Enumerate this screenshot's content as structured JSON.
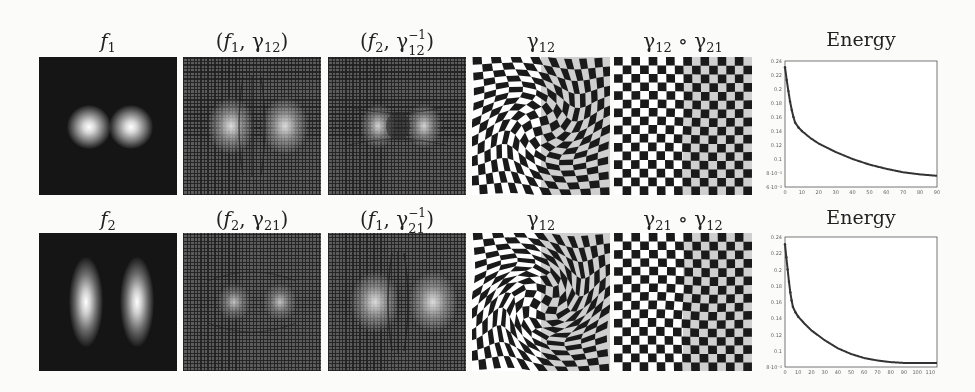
{
  "figure": {
    "rows": [
      {
        "panels": [
          {
            "label_main": "f",
            "label_sub": "1",
            "kind": "density"
          },
          {
            "label": "(f1, γ12)",
            "kind": "warped-grid"
          },
          {
            "label": "(f2, γ12^-1)",
            "kind": "warped-grid"
          },
          {
            "label": "γ12",
            "kind": "checkerboard"
          },
          {
            "label": "γ12 ∘ γ21",
            "kind": "checkerboard"
          }
        ],
        "plot_title": "Energy"
      },
      {
        "panels": [
          {
            "label_main": "f",
            "label_sub": "2",
            "kind": "density"
          },
          {
            "label": "(f2, γ21)",
            "kind": "warped-grid"
          },
          {
            "label": "(f1, γ21^-1)",
            "kind": "warped-grid"
          },
          {
            "label": "γ12",
            "kind": "checkerboard"
          },
          {
            "label": "γ21 ∘ γ12",
            "kind": "checkerboard"
          }
        ],
        "plot_title": "Energy"
      }
    ],
    "colors": {
      "background": "#fbfbfa",
      "dark": "#151515",
      "grid_gray": "#5b5b5b",
      "checker_gray": "#a8a8a8",
      "curve": "#333333"
    }
  },
  "labels": {
    "r1p1_main": "f",
    "r1p1_sub": "1",
    "r1p2_open": "(",
    "r1p2_f": "f",
    "r1p2_fsub": "1",
    "r1p2_comma": ", γ",
    "r1p2_gsub": "12",
    "r1p2_close": ")",
    "r1p3_open": "(",
    "r1p3_f": "f",
    "r1p3_fsub": "2",
    "r1p3_comma": ", γ",
    "r1p3_sup": "−1",
    "r1p3_gsub": "12",
    "r1p3_close": ")",
    "r1p4_g": "γ",
    "r1p4_sub": "12",
    "r1p5_g1": "γ",
    "r1p5_s1": "12",
    "r1p5_op": " ∘ γ",
    "r1p5_s2": "21",
    "r2p1_main": "f",
    "r2p1_sub": "2",
    "r2p2_open": "(",
    "r2p2_f": "f",
    "r2p2_fsub": "2",
    "r2p2_comma": ", γ",
    "r2p2_gsub": "21",
    "r2p2_close": ")",
    "r2p3_open": "(",
    "r2p3_f": "f",
    "r2p3_fsub": "1",
    "r2p3_comma": ", γ",
    "r2p3_sup": "−1",
    "r2p3_gsub": "21",
    "r2p3_close": ")",
    "r2p4_g": "γ",
    "r2p4_sub": "12",
    "r2p5_g1": "γ",
    "r2p5_s1": "21",
    "r2p5_op": " ∘ γ",
    "r2p5_s2": "12",
    "plot1_title": "Energy",
    "plot2_title": "Energy"
  },
  "chart_data": [
    {
      "type": "line",
      "title": "Energy",
      "xlabel": "",
      "ylabel": "",
      "xlim": [
        0,
        90
      ],
      "ylim": [
        0.06,
        0.24
      ],
      "x_ticks": [
        "0",
        "10",
        "20",
        "30",
        "40",
        "50",
        "60",
        "70",
        "80",
        "90"
      ],
      "y_ticks": [
        "0.24",
        "0.22",
        "0.2",
        "0.18",
        "0.16",
        "0.14",
        "0.12",
        "0.1",
        "8·10⁻²",
        "6·10⁻²"
      ],
      "grid": false,
      "x": [
        0,
        1,
        2,
        3,
        4,
        5,
        6,
        8,
        10,
        15,
        20,
        30,
        40,
        50,
        60,
        70,
        80,
        90
      ],
      "values": [
        0.231,
        0.213,
        0.197,
        0.182,
        0.17,
        0.16,
        0.152,
        0.145,
        0.14,
        0.13,
        0.122,
        0.11,
        0.1,
        0.092,
        0.086,
        0.081,
        0.078,
        0.076
      ]
    },
    {
      "type": "line",
      "title": "Energy",
      "xlabel": "",
      "ylabel": "",
      "xlim": [
        0,
        115
      ],
      "ylim": [
        0.08,
        0.24
      ],
      "x_ticks": [
        "0",
        "10",
        "20",
        "30",
        "40",
        "50",
        "60",
        "70",
        "80",
        "90",
        "100",
        "110"
      ],
      "y_ticks": [
        "0.24",
        "0.22",
        "0.2",
        "0.18",
        "0.16",
        "0.14",
        "0.12",
        "0.1",
        "8·10⁻²"
      ],
      "grid": false,
      "x": [
        0,
        1,
        2,
        3,
        4,
        5,
        6,
        8,
        10,
        15,
        20,
        30,
        40,
        50,
        60,
        70,
        80,
        90,
        100,
        110,
        115
      ],
      "values": [
        0.231,
        0.215,
        0.2,
        0.185,
        0.172,
        0.162,
        0.154,
        0.147,
        0.142,
        0.133,
        0.125,
        0.113,
        0.103,
        0.096,
        0.091,
        0.088,
        0.086,
        0.085,
        0.085,
        0.085,
        0.085
      ]
    }
  ]
}
